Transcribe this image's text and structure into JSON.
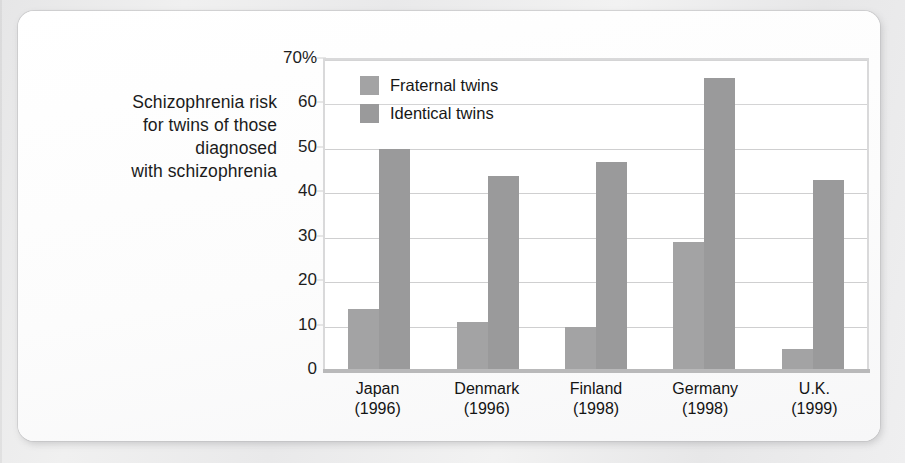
{
  "caption": {
    "lines": [
      "Schizophrenia risk",
      "for twins of those",
      "diagnosed",
      "with schizophrenia"
    ]
  },
  "chart_data": {
    "type": "bar",
    "title": "Schizophrenia risk for twins of those diagnosed with schizophrenia",
    "xlabel": "",
    "ylabel": "",
    "ylim": [
      0,
      70
    ],
    "grid": true,
    "legend_position": "top-left-inside",
    "categories": [
      "Japan\n(1996)",
      "Denmark\n(1996)",
      "Finland\n(1998)",
      "Germany\n(1998)",
      "U.K.\n(1999)"
    ],
    "category_names": [
      "Japan",
      "Denmark",
      "Finland",
      "Germany",
      "U.K."
    ],
    "category_years": [
      "(1996)",
      "(1996)",
      "(1998)",
      "(1998)",
      "(1999)"
    ],
    "tick_labels": [
      "70%",
      "60",
      "50",
      "40",
      "30",
      "20",
      "10",
      "0"
    ],
    "tick_values": [
      70,
      60,
      50,
      40,
      30,
      20,
      10,
      0
    ],
    "series": [
      {
        "name": "Fraternal twins",
        "color": "#a3a3a4",
        "values": [
          14,
          11,
          10,
          29,
          5
        ]
      },
      {
        "name": "Identical twins",
        "color": "#9a9a9b",
        "values": [
          50,
          44,
          47,
          66,
          43
        ]
      }
    ]
  },
  "colors": {
    "bar_fraternal": "#a3a3a4",
    "bar_identical": "#9a9a9b",
    "gridline": "#cfcfd0",
    "axis": "#b9b9ba",
    "text": "#1b1b1b",
    "card": "#fdfdfd",
    "page": "#ececed"
  }
}
